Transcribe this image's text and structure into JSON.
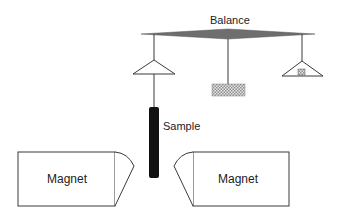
{
  "diagram": {
    "labels": {
      "balance": "Balance",
      "sample": "Sample",
      "magnet_left": "Magnet",
      "magnet_right": "Magnet"
    },
    "components": [
      {
        "id": "balance-beam",
        "type": "beam",
        "label": "Balance"
      },
      {
        "id": "left-pan",
        "type": "triangle-pan",
        "holds": "sample"
      },
      {
        "id": "center-counterweight",
        "type": "hatched-block"
      },
      {
        "id": "right-pan",
        "type": "triangle-pan",
        "holds": "small weight"
      },
      {
        "id": "sample",
        "type": "cylinder",
        "label": "Sample"
      },
      {
        "id": "magnet-left",
        "type": "magnet",
        "label": "Magnet"
      },
      {
        "id": "magnet-right",
        "type": "magnet",
        "label": "Magnet"
      }
    ],
    "colors": {
      "beam": "#6e6e6e",
      "line": "#3a3a3a",
      "sample": "#111111",
      "hatch": "#9a9a9a",
      "background": "#ffffff"
    }
  }
}
